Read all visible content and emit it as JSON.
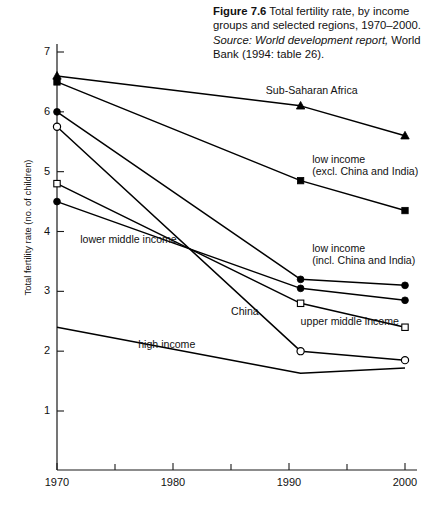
{
  "caption": {
    "figure_number": "Figure 7.6",
    "title": "Total fertility rate, by income groups and selected regions, 1970–2000.",
    "source_word": "Source:",
    "source_title": "World development report,",
    "source_publisher": "World Bank (1994: table 26)."
  },
  "chart_data": {
    "type": "line",
    "title": "Total fertility rate, by income groups and selected regions, 1970–2000",
    "xlabel": "",
    "ylabel": "Total fertility rate (no. of children)",
    "xlim": [
      1970,
      2000
    ],
    "ylim": [
      0,
      7
    ],
    "xticks": [
      1970,
      1980,
      1990,
      2000
    ],
    "xticks_minor": [
      1975,
      1985,
      1995
    ],
    "yticks": [
      1,
      2,
      3,
      4,
      5,
      6,
      7
    ],
    "grid": false,
    "legend_position": "inline-annotations",
    "line_color": "#000000",
    "series": [
      {
        "name": "Sub-Saharan Africa",
        "marker": "triangle-filled",
        "x": [
          1970,
          1991,
          2000
        ],
        "values": [
          6.6,
          6.1,
          5.6
        ]
      },
      {
        "name": "low income (excl. China and India)",
        "label_line1": "low income",
        "label_line2": "(excl. China and India)",
        "marker": "square-filled",
        "x": [
          1970,
          1991,
          2000
        ],
        "values": [
          6.5,
          4.85,
          4.35
        ]
      },
      {
        "name": "low income (incl. China and India)",
        "label_line1": "low income",
        "label_line2": "(incl. China and India)",
        "marker": "circle-filled",
        "x": [
          1970,
          1991,
          2000
        ],
        "values": [
          6.0,
          3.2,
          3.1
        ]
      },
      {
        "name": "lower middle income",
        "marker": "circle-filled",
        "x": [
          1970,
          1991,
          2000
        ],
        "values": [
          4.5,
          3.05,
          2.85
        ]
      },
      {
        "name": "upper middle income",
        "marker": "square-open",
        "x": [
          1970,
          1991,
          2000
        ],
        "values": [
          4.8,
          2.8,
          2.4
        ]
      },
      {
        "name": "China",
        "marker": "circle-open",
        "x": [
          1970,
          1991,
          2000
        ],
        "values": [
          5.75,
          2.0,
          1.85
        ]
      },
      {
        "name": "high income",
        "marker": "none",
        "x": [
          1970,
          1991,
          2000
        ],
        "values": [
          2.4,
          1.63,
          1.72
        ]
      }
    ],
    "annotations": [
      {
        "text": "Sub-Saharan Africa",
        "at_x": 1988,
        "at_y": 6.35
      },
      {
        "text": "low income",
        "at_x": 1992,
        "at_y": 5.2
      },
      {
        "text": "(excl. China and India)",
        "at_x": 1992,
        "at_y": 5.0
      },
      {
        "text": "low income",
        "at_x": 1992,
        "at_y": 3.7
      },
      {
        "text": "(incl. China and India)",
        "at_x": 1992,
        "at_y": 3.5
      },
      {
        "text": "lower middle income",
        "at_x": 1972,
        "at_y": 3.85
      },
      {
        "text": "China",
        "at_x": 1985,
        "at_y": 2.65
      },
      {
        "text": "upper middle income",
        "at_x": 1991,
        "at_y": 2.48
      },
      {
        "text": "high income",
        "at_x": 1977,
        "at_y": 2.1
      }
    ]
  },
  "axis": {
    "y_title": "Total fertility rate (no. of children)",
    "y_labels": [
      "7",
      "6",
      "5",
      "4",
      "3",
      "2",
      "1"
    ],
    "x_labels": [
      "1970",
      "1980",
      "1990",
      "2000"
    ]
  }
}
